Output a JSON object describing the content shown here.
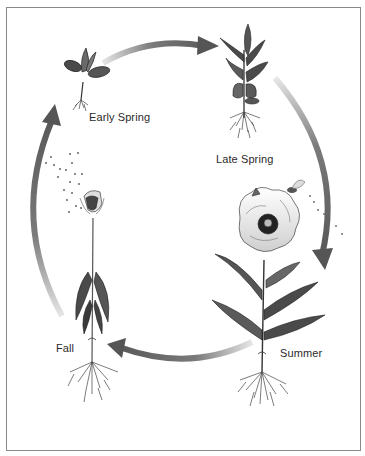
{
  "diagram": {
    "type": "life-cycle",
    "stages": [
      {
        "id": "early-spring",
        "label": "Early Spring",
        "description": "seedling with two cotyledons and small root"
      },
      {
        "id": "late-spring",
        "label": "Late Spring",
        "description": "leafy young plant with branching roots"
      },
      {
        "id": "summer",
        "label": "Summer",
        "description": "flowering poppy visited by a pollinating insect"
      },
      {
        "id": "fall",
        "label": "Fall",
        "description": "seed head dispersing seeds, withered leaves"
      }
    ],
    "arrows": [
      {
        "from": "early-spring",
        "to": "late-spring"
      },
      {
        "from": "late-spring",
        "to": "summer"
      },
      {
        "from": "summer",
        "to": "fall"
      },
      {
        "from": "fall",
        "to": "early-spring"
      }
    ],
    "colors": {
      "arrow_dark": "#555555",
      "arrow_light": "#dddddd",
      "leaf": "#4a4a4a",
      "frame": "#8a8a8a",
      "text": "#2a2a2a"
    }
  }
}
